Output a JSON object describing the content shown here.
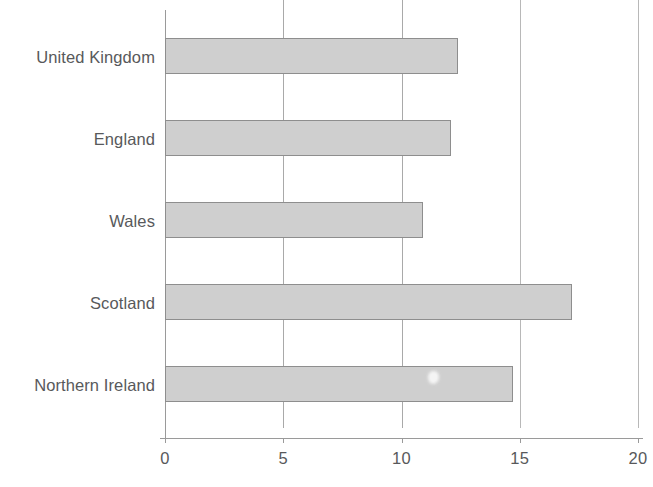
{
  "chart_data": {
    "type": "bar",
    "orientation": "horizontal",
    "title": "",
    "subtitle": "",
    "xlabel": "",
    "ylabel": "",
    "categories": [
      "United Kingdom",
      "England",
      "Wales",
      "Scotland",
      "Northern Ireland"
    ],
    "values": [
      12.4,
      12.1,
      10.9,
      17.2,
      14.7
    ],
    "xlim": [
      0,
      20
    ],
    "xticks": [
      0,
      5,
      10,
      15,
      20
    ],
    "xtick_labels": [
      "0",
      "5",
      "10",
      "15",
      "20"
    ],
    "grid": true,
    "grid_axis": "x",
    "legend": null,
    "annotations": [],
    "series": [
      {
        "name": "",
        "values": [
          12.4,
          12.1,
          10.9,
          17.2,
          14.7
        ]
      }
    ]
  },
  "axis": {
    "ticks": [
      {
        "label": "0",
        "value": 0
      },
      {
        "label": "5",
        "value": 5
      },
      {
        "label": "10",
        "value": 10
      },
      {
        "label": "15",
        "value": 15
      },
      {
        "label": "20",
        "value": 20
      }
    ]
  },
  "categories": [
    {
      "label": "United Kingdom",
      "value": 12.4
    },
    {
      "label": "England",
      "value": 12.1
    },
    {
      "label": "Wales",
      "value": 10.9
    },
    {
      "label": "Scotland",
      "value": 17.2
    },
    {
      "label": "Northern Ireland",
      "value": 14.7
    }
  ],
  "colors": {
    "bar_fill": "#cfcfcf",
    "bar_stroke": "#8e8e8e",
    "gridline": "#a9a9a9",
    "axis": "#9a9a9a",
    "text": "#58595b",
    "background": "#ffffff"
  }
}
